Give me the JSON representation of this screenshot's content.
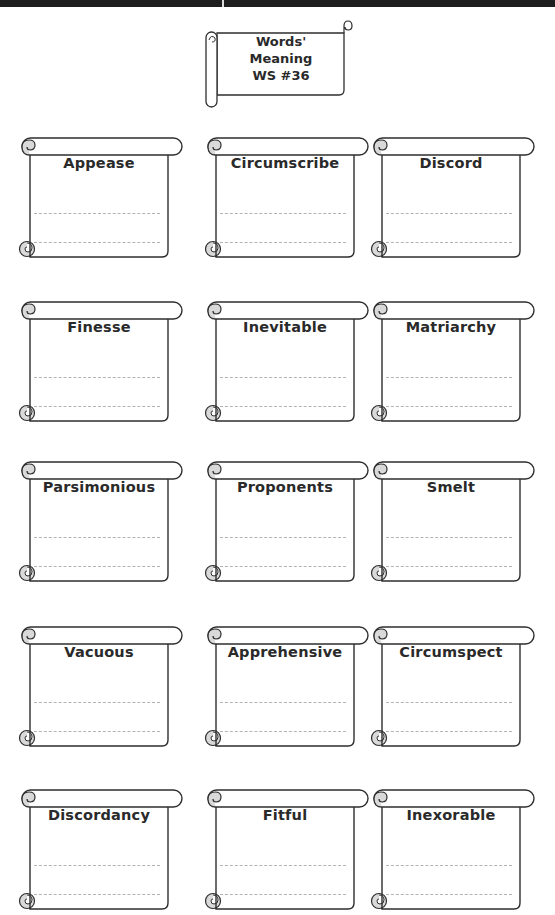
{
  "top_band": {
    "color": "#1e1e1e"
  },
  "header": {
    "line1": "Words'",
    "line2": "Meaning",
    "line3": "WS #36"
  },
  "colors": {
    "outline": "#2e2e2e",
    "curl_fill": "#d9d9d9",
    "dashed_line": "#b3b3b3",
    "text": "#2a2a2a"
  },
  "words": [
    {
      "word": "Appease"
    },
    {
      "word": "Circumscribe"
    },
    {
      "word": "Discord"
    },
    {
      "word": "Finesse"
    },
    {
      "word": "Inevitable"
    },
    {
      "word": "Matriarchy"
    },
    {
      "word": "Parsimonious"
    },
    {
      "word": "Proponents"
    },
    {
      "word": "Smelt"
    },
    {
      "word": "Vacuous"
    },
    {
      "word": "Apprehensive"
    },
    {
      "word": "Circumspect"
    },
    {
      "word": "Discordancy"
    },
    {
      "word": "Fitful"
    },
    {
      "word": "Inexorable"
    }
  ]
}
